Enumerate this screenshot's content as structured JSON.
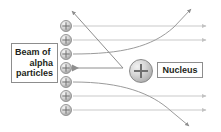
{
  "figure": {
    "background_color": "#ffffff",
    "ray_color": "#b9b9b9",
    "deflection_color": "#8e8e8e",
    "particle_color": "#9a9a9a",
    "text_color": "#231f20",
    "border_color": "#8d8d8d"
  },
  "beam_label": {
    "line1": "Beam of",
    "line2": "alpha",
    "line3": "particles"
  },
  "nucleus_label": {
    "text": "Nucleus"
  },
  "nucleus": {
    "charge_symbol": "+"
  },
  "alpha_particles": [
    {
      "id": 1,
      "symbol": "+",
      "cx": 66,
      "cy": 26
    },
    {
      "id": 2,
      "symbol": "+",
      "cx": 66,
      "cy": 40
    },
    {
      "id": 3,
      "symbol": "+",
      "cx": 66,
      "cy": 54
    },
    {
      "id": 4,
      "symbol": "+",
      "cx": 66,
      "cy": 68
    },
    {
      "id": 5,
      "symbol": "+",
      "cx": 66,
      "cy": 82
    },
    {
      "id": 6,
      "symbol": "+",
      "cx": 66,
      "cy": 96
    },
    {
      "id": 7,
      "symbol": "+",
      "cx": 66,
      "cy": 110
    }
  ],
  "trajectories": [
    {
      "name": "ray-1-undeflected",
      "kind": "straight",
      "path": "M 73 26 L 209 26",
      "arrow": true
    },
    {
      "name": "ray-2-undeflected",
      "kind": "straight",
      "path": "M 73 40 L 209 40",
      "arrow": true
    },
    {
      "name": "ray-3-deflected-up",
      "kind": "curved",
      "path": "M 73 54 C 120 54 150 48 175 28 L 192 8",
      "arrow": true
    },
    {
      "name": "ray-4-backscattered",
      "kind": "straight",
      "path": "M 73 68 L 124 68",
      "arrow": true
    },
    {
      "name": "ray-5-deflected-down",
      "kind": "curved",
      "path": "M 73 82 C 120 82 150 92 172 112 L 190 127",
      "arrow": true
    },
    {
      "name": "ray-6-undeflected",
      "kind": "straight",
      "path": "M 73 96 L 209 96",
      "arrow": true
    },
    {
      "name": "ray-7-undeflected",
      "kind": "straight",
      "path": "M 73 110 L 209 110",
      "arrow": true
    },
    {
      "name": "backscatter-arrow-upleft",
      "kind": "straight",
      "path": "M 124 68 L 71 10",
      "arrow": true
    }
  ]
}
